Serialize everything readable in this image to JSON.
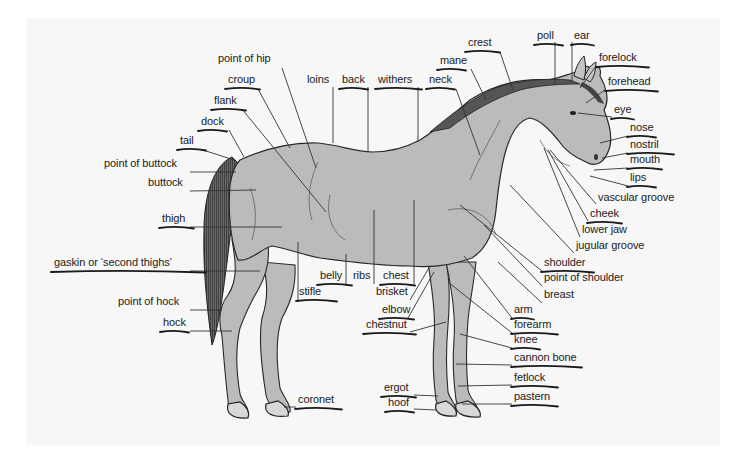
{
  "colors": {
    "panel": "#f7f7f7",
    "coat": "#bdbdbd",
    "outline": "#2a2a2a",
    "text": "#222222",
    "underline": "#1a1a1a"
  },
  "labels": [
    {
      "id": "point-of-hip",
      "text": "point of hip",
      "x": 218,
      "y": 62,
      "underlined": false
    },
    {
      "id": "croup",
      "text": "croup",
      "x": 228,
      "y": 83,
      "underlined": true
    },
    {
      "id": "loins",
      "text": "loins",
      "x": 307,
      "y": 83,
      "underlined": false
    },
    {
      "id": "back",
      "text": "back",
      "x": 342,
      "y": 83,
      "underlined": true
    },
    {
      "id": "withers",
      "text": "withers",
      "x": 378,
      "y": 83,
      "underlined": true
    },
    {
      "id": "neck",
      "text": "neck",
      "x": 429,
      "y": 83,
      "underlined": true
    },
    {
      "id": "mane",
      "text": "mane",
      "x": 440,
      "y": 64,
      "underlined": true
    },
    {
      "id": "crest",
      "text": "crest",
      "x": 468,
      "y": 46,
      "underlined": true
    },
    {
      "id": "poll",
      "text": "poll",
      "x": 537,
      "y": 39,
      "underlined": true
    },
    {
      "id": "ear",
      "text": "ear",
      "x": 574,
      "y": 39,
      "underlined": true
    },
    {
      "id": "forelock",
      "text": "forelock",
      "x": 599,
      "y": 61,
      "underlined": true
    },
    {
      "id": "forehead",
      "text": "forehead",
      "x": 608,
      "y": 85,
      "underlined": true
    },
    {
      "id": "flank",
      "text": "flank",
      "x": 214,
      "y": 104,
      "underlined": true
    },
    {
      "id": "dock",
      "text": "dock",
      "x": 201,
      "y": 125,
      "underlined": true
    },
    {
      "id": "tail",
      "text": "tail",
      "x": 180,
      "y": 144,
      "underlined": true
    },
    {
      "id": "eye",
      "text": "eye",
      "x": 614,
      "y": 113,
      "underlined": true
    },
    {
      "id": "nose",
      "text": "nose",
      "x": 630,
      "y": 131,
      "underlined": true
    },
    {
      "id": "nostril",
      "text": "nostril",
      "x": 630,
      "y": 148,
      "underlined": true
    },
    {
      "id": "mouth",
      "text": "mouth",
      "x": 630,
      "y": 163,
      "underlined": true
    },
    {
      "id": "lips",
      "text": "lips",
      "x": 630,
      "y": 181,
      "underlined": true
    },
    {
      "id": "point-of-buttock",
      "text": "point of buttock",
      "x": 104,
      "y": 167,
      "underlined": false
    },
    {
      "id": "buttock",
      "text": "buttock",
      "x": 148,
      "y": 186,
      "underlined": false
    },
    {
      "id": "vascular-groove",
      "text": "vascular groove",
      "x": 598,
      "y": 201,
      "underlined": false
    },
    {
      "id": "cheek",
      "text": "cheek",
      "x": 590,
      "y": 217,
      "underlined": true
    },
    {
      "id": "thigh",
      "text": "thigh",
      "x": 162,
      "y": 222,
      "underlined": true
    },
    {
      "id": "lower-jaw",
      "text": "lower jaw",
      "x": 582,
      "y": 233,
      "underlined": false
    },
    {
      "id": "jugular-groove",
      "text": "jugular groove",
      "x": 576,
      "y": 249,
      "underlined": false
    },
    {
      "id": "gaskin",
      "text": "gaskin or ‘second thighs’",
      "x": 54,
      "y": 266,
      "underlined": true
    },
    {
      "id": "shoulder",
      "text": "shoulder",
      "x": 544,
      "y": 266,
      "underlined": true
    },
    {
      "id": "point-of-shoulder",
      "text": "point of shoulder",
      "x": 544,
      "y": 281,
      "underlined": false
    },
    {
      "id": "belly",
      "text": "belly",
      "x": 320,
      "y": 279,
      "underlined": true
    },
    {
      "id": "ribs",
      "text": "ribs",
      "x": 353,
      "y": 279,
      "underlined": false
    },
    {
      "id": "chest",
      "text": "chest",
      "x": 383,
      "y": 279,
      "underlined": true
    },
    {
      "id": "point-of-hock",
      "text": "point of hock",
      "x": 118,
      "y": 305,
      "underlined": false
    },
    {
      "id": "stifle",
      "text": "stifle",
      "x": 299,
      "y": 295,
      "underlined": true
    },
    {
      "id": "brisket",
      "text": "brisket",
      "x": 376,
      "y": 295,
      "underlined": false
    },
    {
      "id": "breast",
      "text": "breast",
      "x": 544,
      "y": 298,
      "underlined": false
    },
    {
      "id": "arm",
      "text": "arm",
      "x": 514,
      "y": 313,
      "underlined": true
    },
    {
      "id": "elbow",
      "text": "elbow",
      "x": 382,
      "y": 313,
      "underlined": true
    },
    {
      "id": "chestnut",
      "text": "chestnut",
      "x": 366,
      "y": 328,
      "underlined": true
    },
    {
      "id": "forearm",
      "text": "forearm",
      "x": 514,
      "y": 328,
      "underlined": true
    },
    {
      "id": "hock",
      "text": "hock",
      "x": 163,
      "y": 326,
      "underlined": true
    },
    {
      "id": "knee",
      "text": "knee",
      "x": 514,
      "y": 343,
      "underlined": true
    },
    {
      "id": "cannon-bone",
      "text": "cannon bone",
      "x": 514,
      "y": 361,
      "underlined": true
    },
    {
      "id": "fetlock",
      "text": "fetlock",
      "x": 514,
      "y": 381,
      "underlined": true
    },
    {
      "id": "ergot",
      "text": "ergot",
      "x": 384,
      "y": 391,
      "underlined": true
    },
    {
      "id": "pastern",
      "text": "pastern",
      "x": 514,
      "y": 400,
      "underlined": true
    },
    {
      "id": "coronet",
      "text": "coronet",
      "x": 298,
      "y": 403,
      "underlined": true
    },
    {
      "id": "hoof",
      "text": "hoof",
      "x": 388,
      "y": 406,
      "underlined": true
    }
  ]
}
